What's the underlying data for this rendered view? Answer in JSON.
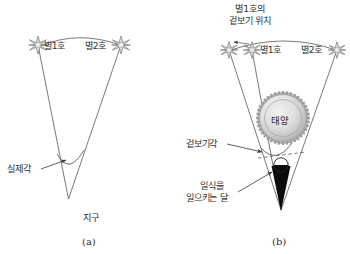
{
  "figure": {
    "background_color": "#ffffff",
    "line_color": "#4a4a5a",
    "text_color": "#2e2e2e"
  },
  "panel_a": {
    "caption": "(a)",
    "star1_label": "별1호",
    "star2_label": "별2호",
    "angle_label": "실제각",
    "earth_label": "지구",
    "icons": {
      "star": "star-icon",
      "arrow": "arrow-icon"
    }
  },
  "panel_b": {
    "caption": "(b)",
    "apparent_position_label_line1": "별1호의",
    "apparent_position_label_line2": "겉보기 위치",
    "star1_label": "별1호",
    "star2_label": "별2호",
    "sun_label": "태양",
    "apparent_angle_label": "겉보기각",
    "moon_label_line1": "일식을",
    "moon_label_line2": "일으키는 달",
    "icons": {
      "star": "star-icon",
      "sun": "sun-icon",
      "moon_shadow": "moon-shadow-cone-icon",
      "arrow": "arrow-icon"
    }
  }
}
